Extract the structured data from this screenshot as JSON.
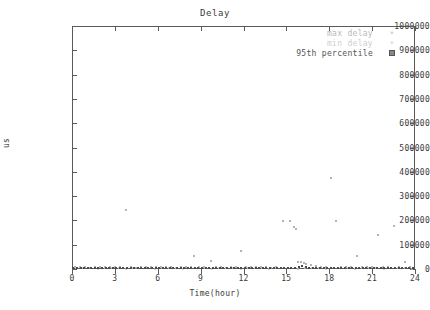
{
  "title": "Delay",
  "axes": {
    "x_label": "Time(hour)",
    "y_label": "us",
    "x_ticks": [
      "0",
      "3",
      "6",
      "9",
      "12",
      "15",
      "18",
      "21",
      "24"
    ],
    "y_ticks": [
      "0",
      "100000",
      "200000",
      "300000",
      "400000",
      "500000",
      "600000",
      "700000",
      "800000",
      "900000",
      "1000000"
    ]
  },
  "legend": {
    "entries": [
      {
        "label": "max delay",
        "marker": "star-marker",
        "color": "#b9b9b9"
      },
      {
        "label": "min delay",
        "marker": "plus-marker",
        "color": "#cfcfcf"
      },
      {
        "label": "95th percentile",
        "marker": "square-marker",
        "color": "#555555"
      }
    ]
  },
  "chart_data": {
    "type": "scatter",
    "title": "Delay",
    "xlabel": "Time(hour)",
    "ylabel": "us",
    "xlim": [
      0,
      24
    ],
    "ylim": [
      0,
      1000000
    ],
    "grid": false,
    "legend_position": "top-right-inside",
    "series": [
      {
        "name": "max delay",
        "marker": "star-marker",
        "color": "#9a9a9a",
        "points": [
          [
            3.8,
            243000
          ],
          [
            8.55,
            52000
          ],
          [
            9.7,
            33000
          ],
          [
            11.85,
            76000
          ],
          [
            14.75,
            198000
          ],
          [
            15.25,
            196000
          ],
          [
            15.55,
            172000
          ],
          [
            15.65,
            166000
          ],
          [
            15.8,
            30000
          ],
          [
            16.05,
            28000
          ],
          [
            16.2,
            24000
          ],
          [
            16.35,
            21000
          ],
          [
            18.1,
            375000
          ],
          [
            18.45,
            198000
          ],
          [
            19.95,
            55000
          ],
          [
            21.4,
            140000
          ],
          [
            22.55,
            178000
          ],
          [
            23.3,
            30000
          ],
          [
            0.2,
            9000
          ],
          [
            0.55,
            7000
          ],
          [
            0.9,
            8500
          ],
          [
            1.25,
            6000
          ],
          [
            1.6,
            9500
          ],
          [
            1.95,
            7000
          ],
          [
            2.3,
            8000
          ],
          [
            2.65,
            6500
          ],
          [
            3.0,
            9000
          ],
          [
            3.35,
            7500
          ],
          [
            4.15,
            8000
          ],
          [
            4.5,
            6000
          ],
          [
            4.85,
            9500
          ],
          [
            5.2,
            7000
          ],
          [
            5.55,
            8500
          ],
          [
            5.9,
            6500
          ],
          [
            6.25,
            9000
          ],
          [
            6.6,
            7000
          ],
          [
            6.95,
            8000
          ],
          [
            7.3,
            6000
          ],
          [
            7.65,
            9500
          ],
          [
            8.0,
            7500
          ],
          [
            8.35,
            8000
          ],
          [
            8.9,
            6500
          ],
          [
            9.25,
            9000
          ],
          [
            10.05,
            7000
          ],
          [
            10.4,
            8500
          ],
          [
            10.75,
            6000
          ],
          [
            11.1,
            9500
          ],
          [
            11.45,
            7500
          ],
          [
            12.2,
            8000
          ],
          [
            12.55,
            6500
          ],
          [
            12.9,
            9000
          ],
          [
            13.25,
            7000
          ],
          [
            13.6,
            8500
          ],
          [
            13.95,
            6000
          ],
          [
            14.3,
            9500
          ],
          [
            16.7,
            18000
          ],
          [
            17.05,
            13000
          ],
          [
            17.4,
            9000
          ],
          [
            17.75,
            8000
          ],
          [
            18.8,
            7500
          ],
          [
            19.15,
            9000
          ],
          [
            19.5,
            8000
          ],
          [
            20.3,
            7000
          ],
          [
            20.65,
            9500
          ],
          [
            21.0,
            8000
          ],
          [
            21.75,
            7000
          ],
          [
            22.1,
            9000
          ],
          [
            22.9,
            8500
          ],
          [
            23.65,
            7000
          ]
        ]
      },
      {
        "name": "min delay",
        "marker": "plus-marker",
        "color": "#c4c4c4",
        "points": [
          [
            0.3,
            3000
          ],
          [
            0.8,
            2500
          ],
          [
            1.3,
            3500
          ],
          [
            1.8,
            2000
          ],
          [
            2.3,
            3000
          ],
          [
            2.8,
            2500
          ],
          [
            3.3,
            3500
          ],
          [
            3.8,
            2000
          ],
          [
            4.3,
            3000
          ],
          [
            4.8,
            2500
          ],
          [
            5.3,
            3500
          ],
          [
            5.8,
            2000
          ],
          [
            6.3,
            3000
          ],
          [
            6.8,
            2500
          ],
          [
            7.3,
            3500
          ],
          [
            7.8,
            2000
          ],
          [
            8.3,
            3000
          ],
          [
            8.8,
            2500
          ],
          [
            9.3,
            3500
          ],
          [
            9.8,
            2000
          ],
          [
            10.3,
            3000
          ],
          [
            10.8,
            2500
          ],
          [
            11.3,
            3500
          ],
          [
            11.8,
            2000
          ],
          [
            12.3,
            3000
          ],
          [
            12.8,
            2500
          ],
          [
            13.3,
            3500
          ],
          [
            13.8,
            2000
          ],
          [
            14.3,
            3000
          ],
          [
            14.8,
            2500
          ],
          [
            15.3,
            3500
          ],
          [
            15.8,
            2000
          ],
          [
            16.3,
            3000
          ],
          [
            16.8,
            2500
          ],
          [
            17.3,
            3500
          ],
          [
            17.8,
            2000
          ],
          [
            18.3,
            3000
          ],
          [
            18.8,
            2500
          ],
          [
            19.3,
            3500
          ],
          [
            19.8,
            2000
          ],
          [
            20.3,
            3000
          ],
          [
            20.8,
            2500
          ],
          [
            21.3,
            3500
          ],
          [
            21.8,
            2000
          ],
          [
            22.3,
            3000
          ],
          [
            22.8,
            2500
          ],
          [
            23.3,
            3500
          ],
          [
            23.8,
            2000
          ]
        ]
      },
      {
        "name": "95th percentile",
        "marker": "square-marker",
        "color": "#4a4a4a",
        "points": [
          [
            0.1,
            4000
          ],
          [
            0.35,
            5000
          ],
          [
            0.6,
            4500
          ],
          [
            0.85,
            5500
          ],
          [
            1.1,
            4000
          ],
          [
            1.35,
            5000
          ],
          [
            1.6,
            4500
          ],
          [
            1.85,
            5500
          ],
          [
            2.1,
            4000
          ],
          [
            2.35,
            5000
          ],
          [
            2.6,
            4500
          ],
          [
            2.85,
            5500
          ],
          [
            3.1,
            4000
          ],
          [
            3.35,
            5000
          ],
          [
            3.6,
            4500
          ],
          [
            3.85,
            5500
          ],
          [
            4.1,
            4000
          ],
          [
            4.35,
            5000
          ],
          [
            4.6,
            4500
          ],
          [
            4.85,
            5500
          ],
          [
            5.1,
            4000
          ],
          [
            5.35,
            5000
          ],
          [
            5.6,
            4500
          ],
          [
            5.85,
            5500
          ],
          [
            6.1,
            4000
          ],
          [
            6.35,
            5000
          ],
          [
            6.6,
            4500
          ],
          [
            6.85,
            5500
          ],
          [
            7.1,
            4000
          ],
          [
            7.35,
            5000
          ],
          [
            7.6,
            4500
          ],
          [
            7.85,
            5500
          ],
          [
            8.1,
            4000
          ],
          [
            8.35,
            5000
          ],
          [
            8.6,
            4500
          ],
          [
            8.85,
            5500
          ],
          [
            9.1,
            4000
          ],
          [
            9.35,
            5000
          ],
          [
            9.6,
            4500
          ],
          [
            9.85,
            5500
          ],
          [
            10.1,
            4000
          ],
          [
            10.35,
            5000
          ],
          [
            10.6,
            4500
          ],
          [
            10.85,
            5500
          ],
          [
            11.1,
            4000
          ],
          [
            11.35,
            5000
          ],
          [
            11.6,
            4500
          ],
          [
            11.85,
            5500
          ],
          [
            12.1,
            4000
          ],
          [
            12.35,
            5000
          ],
          [
            12.6,
            4500
          ],
          [
            12.85,
            5500
          ],
          [
            13.1,
            4000
          ],
          [
            13.35,
            5000
          ],
          [
            13.6,
            4500
          ],
          [
            13.85,
            5500
          ],
          [
            14.1,
            4000
          ],
          [
            14.35,
            5000
          ],
          [
            14.6,
            4500
          ],
          [
            14.85,
            5500
          ],
          [
            15.1,
            4000
          ],
          [
            15.35,
            5000
          ],
          [
            15.6,
            4500
          ],
          [
            15.85,
            9000
          ],
          [
            16.1,
            12000
          ],
          [
            16.35,
            10000
          ],
          [
            16.6,
            6000
          ],
          [
            16.85,
            5000
          ],
          [
            17.1,
            4500
          ],
          [
            17.35,
            5500
          ],
          [
            17.6,
            4000
          ],
          [
            17.85,
            5000
          ],
          [
            18.1,
            4500
          ],
          [
            18.35,
            5500
          ],
          [
            18.6,
            4000
          ],
          [
            18.85,
            5000
          ],
          [
            19.1,
            4500
          ],
          [
            19.35,
            5500
          ],
          [
            19.6,
            4000
          ],
          [
            19.85,
            5000
          ],
          [
            20.1,
            4500
          ],
          [
            20.35,
            5500
          ],
          [
            20.6,
            4000
          ],
          [
            20.85,
            5000
          ],
          [
            21.1,
            4500
          ],
          [
            21.35,
            5500
          ],
          [
            21.6,
            4000
          ],
          [
            21.85,
            5000
          ],
          [
            22.1,
            4500
          ],
          [
            22.35,
            5500
          ],
          [
            22.6,
            4000
          ],
          [
            22.85,
            5000
          ],
          [
            23.1,
            4500
          ],
          [
            23.35,
            5500
          ],
          [
            23.6,
            4000
          ],
          [
            23.85,
            5000
          ]
        ]
      }
    ]
  }
}
